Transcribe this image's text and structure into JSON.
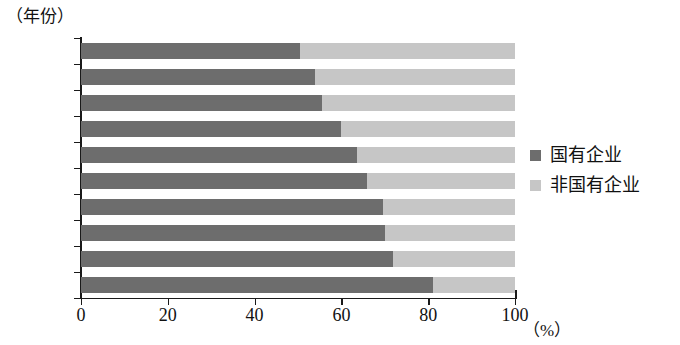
{
  "chart_data": {
    "type": "bar",
    "orientation": "horizontal",
    "stacked": true,
    "stack_total": 100,
    "title": "",
    "subtitle": "",
    "xlabel": "（%）",
    "ylabel": "（年份）",
    "xlim": [
      0,
      100
    ],
    "xticks": [
      "0",
      "20",
      "40",
      "60",
      "80",
      "100"
    ],
    "xtick_values": [
      0,
      20,
      40,
      60,
      80,
      100
    ],
    "grid": false,
    "legend_position": "right",
    "categories": [
      "2015",
      "2014",
      "2013",
      "2012",
      "2011",
      "2010",
      "2009",
      "2008",
      "2007",
      "2006"
    ],
    "series": [
      {
        "name": "国有企业",
        "color": "#6d6d6d",
        "values": [
          50.5,
          54,
          55.5,
          60,
          63.5,
          66,
          69.5,
          70,
          72,
          81
        ]
      },
      {
        "name": "非国有企业",
        "color": "#c6c6c6",
        "values": [
          49.5,
          46,
          44.5,
          40,
          36.5,
          34,
          30.5,
          30,
          28,
          19
        ]
      }
    ]
  },
  "legend": {
    "items": [
      {
        "label": "国有企业",
        "color": "#6d6d6d"
      },
      {
        "label": "非国有企业",
        "color": "#c6c6c6"
      }
    ]
  },
  "axes": {
    "y_unit": "（年份）",
    "x_unit": "（%）"
  }
}
